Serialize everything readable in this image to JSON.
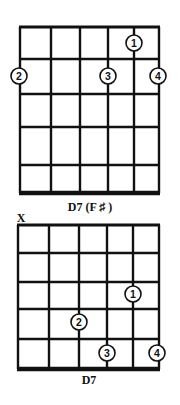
{
  "diagrams": [
    {
      "name": "D7 (F#)",
      "label": "D7 (F ♯ )",
      "strings": 6,
      "frets": 5,
      "muted": [],
      "fingers": [
        {
          "finger": "1",
          "string": 5,
          "fret": 1
        },
        {
          "finger": "2",
          "string": 1,
          "fret": 2
        },
        {
          "finger": "3",
          "string": 4,
          "fret": 2
        },
        {
          "finger": "4",
          "string": 6,
          "fret": 2
        }
      ]
    },
    {
      "name": "D7",
      "label": "D7",
      "strings": 6,
      "frets": 5,
      "muted": [
        {
          "string": 1,
          "symbol": "X"
        }
      ],
      "fingers": [
        {
          "finger": "1",
          "string": 5,
          "fret": 3
        },
        {
          "finger": "2",
          "string": 3,
          "fret": 4
        },
        {
          "finger": "3",
          "string": 4,
          "fret": 5
        },
        {
          "finger": "4",
          "string": 6,
          "fret": 5
        }
      ]
    }
  ],
  "colors": {
    "ink": "#111111",
    "background": "#ffffff"
  }
}
